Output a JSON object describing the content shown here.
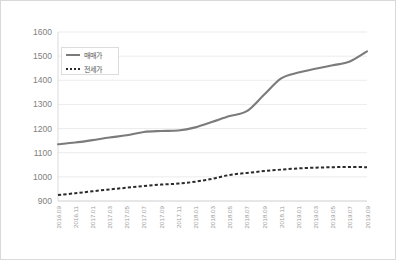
{
  "chart_data": {
    "type": "line",
    "title": "",
    "xlabel": "",
    "ylabel": "",
    "ylim": [
      900,
      1600
    ],
    "ytick_step": 100,
    "yticks": [
      900,
      1000,
      1100,
      1200,
      1300,
      1400,
      1500,
      1600
    ],
    "grid": true,
    "legend_position": "top-left-inside",
    "categories": [
      "2016.09",
      "2016.11",
      "2017.01",
      "2017.03",
      "2017.05",
      "2017.07",
      "2017.09",
      "2017.11",
      "2018.01",
      "2018.03",
      "2018.05",
      "2018.07",
      "2018.09",
      "2018.11",
      "2019.01",
      "2019.03",
      "2019.05",
      "2019.07",
      "2019.09"
    ],
    "series": [
      {
        "name": "매매가",
        "style": "solid",
        "color": "#7b7b7b",
        "values": [
          1135,
          1142,
          1152,
          1163,
          1172,
          1186,
          1190,
          1192,
          1205,
          1228,
          1252,
          1272,
          1340,
          1408,
          1432,
          1448,
          1462,
          1478,
          1520
        ]
      },
      {
        "name": "전세가",
        "style": "dashed",
        "color": "#2b2b2b",
        "values": [
          925,
          932,
          940,
          948,
          955,
          962,
          968,
          972,
          980,
          992,
          1008,
          1016,
          1024,
          1030,
          1035,
          1038,
          1040,
          1041,
          1040
        ]
      }
    ]
  }
}
